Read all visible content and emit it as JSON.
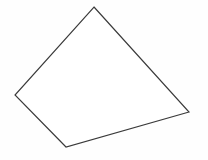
{
  "canvas": {
    "width": 208,
    "height": 160,
    "background_color": "#fefefe",
    "label": "line-drawing-canvas"
  },
  "figure": {
    "name": "quadrilateral",
    "type": "polygon",
    "sides": 4,
    "closed": true,
    "fill_color": "#ffffff",
    "stroke_color": "#3a3a3a",
    "stroke_width": 1.15,
    "vertices": [
      {
        "label": "top-vertex",
        "x": 94,
        "y": 7
      },
      {
        "label": "right-vertex",
        "x": 189,
        "y": 112
      },
      {
        "label": "bottom-vertex",
        "x": 66,
        "y": 147
      },
      {
        "label": "left-vertex",
        "x": 15,
        "y": 95
      }
    ],
    "edges": [
      {
        "label": "top-right-edge",
        "from": "top-vertex",
        "to": "right-vertex"
      },
      {
        "label": "bottom-right-edge",
        "from": "right-vertex",
        "to": "bottom-vertex"
      },
      {
        "label": "bottom-left-edge",
        "from": "bottom-vertex",
        "to": "left-vertex"
      },
      {
        "label": "top-left-edge",
        "from": "left-vertex",
        "to": "top-vertex"
      }
    ],
    "points_attr": "94,7 189,112 66,147 15,95"
  }
}
